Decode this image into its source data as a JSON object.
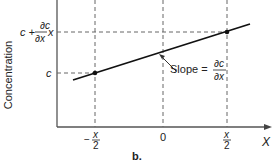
{
  "figure": {
    "panel_label": "b.",
    "y_axis_label": "Concentration",
    "x_axis_label": "X",
    "y_ticks": {
      "upper": {
        "prefix": "c + ",
        "frac_num": "∂c",
        "frac_den": "∂x",
        "suffix": "x"
      },
      "lower": "c"
    },
    "x_ticks": {
      "left": {
        "sign": "−",
        "num": "x",
        "den": "2"
      },
      "center": "0",
      "right": {
        "num": "x",
        "den": "2"
      }
    },
    "annotation": {
      "text": "Slope = ",
      "frac_num": "∂c",
      "frac_den": "∂x"
    },
    "colors": {
      "line": "#111111",
      "axis": "#333333",
      "dashed": "#555555",
      "text": "#222222"
    }
  }
}
